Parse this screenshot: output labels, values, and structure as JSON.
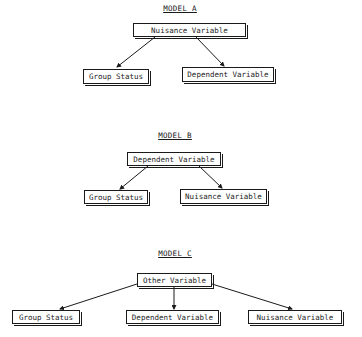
{
  "models": [
    {
      "title": "MODEL A",
      "top": "Nuisance Variable",
      "children": [
        "Group Status",
        "Dependent Variable"
      ]
    },
    {
      "title": "MODEL B",
      "top": "Dependent Variable",
      "children": [
        "Group Status",
        "Nuisance Variable"
      ]
    },
    {
      "title": "MODEL C",
      "top": "Other Variable",
      "children": [
        "Group Status",
        "Dependent Variable",
        "Nuisance Variable"
      ]
    }
  ]
}
